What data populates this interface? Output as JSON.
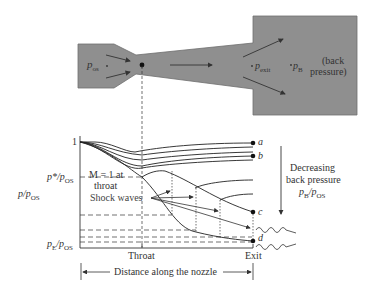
{
  "nozzle": {
    "inlet_label": "p",
    "inlet_sub": "os",
    "exit_label": "p",
    "exit_sub": "exit",
    "back_label": "p",
    "back_sub": "B",
    "back_note_1": "(back",
    "back_note_2": "pressure)",
    "fill_color": "#8f8f8f"
  },
  "chart": {
    "y_axis_label": "p/p",
    "y_axis_label_sub": "OS",
    "tick_one": "1",
    "tick_pstar": "p*/p",
    "tick_pstar_sub": "OS",
    "tick_pe": "p",
    "tick_pe_sub1": "E",
    "tick_pe_sub2": "/p",
    "tick_pe_sub3": "OS",
    "m1_line1": "M = 1 at",
    "m1_line2": "throat",
    "shock_label": "Shock waves",
    "curve_labels": [
      "a",
      "b",
      "c",
      "d"
    ],
    "x_tick_throat": "Throat",
    "x_tick_exit": "Exit",
    "distance_label": "Distance along the nozzle",
    "decreasing_1": "Decreasing",
    "decreasing_2": "back pressure",
    "decreasing_3": "p",
    "decreasing_3_sub": "B",
    "decreasing_3_rest": "/p",
    "decreasing_3_sub2": "OS"
  }
}
